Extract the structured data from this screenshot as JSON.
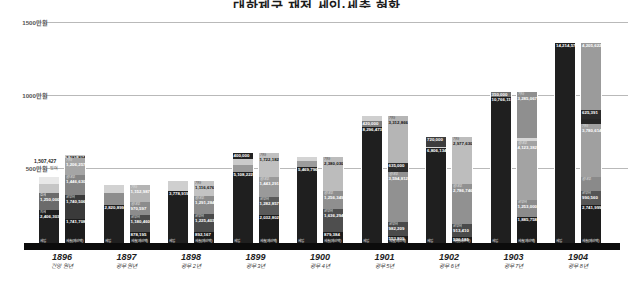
{
  "title": "대한제국 재정 세입·세출 현황",
  "axis": {
    "yticks": [
      {
        "label": "1500만원",
        "value": 15000000
      },
      {
        "label": "1000만원",
        "value": 10000000
      },
      {
        "label": "500만원",
        "value": 5000000
      }
    ],
    "ymax": 15600000,
    "ylabel": "",
    "xlabel": ""
  },
  "legend": {
    "revenue_caption": "세입",
    "expenditure_caption": "세출(예산액)"
  },
  "colors": {
    "revenue_dark": "#2b2b2b",
    "revenue_mid": "#6e6e6e",
    "revenue_light": "#bdbdbd",
    "revenue_pale": "#e2e2e2",
    "expenditure_dark": "#262626",
    "expenditure_mid": "#8f8f8f",
    "expenditure_light": "#a8a8a8",
    "expenditure_pale": "#cfcfcf",
    "axis": "#0c0c0c",
    "grid": "#b9b9b9"
  },
  "chart_data": {
    "type": "bar",
    "subtype": "grouped-stacked",
    "title": "대한제국 재정 세입·세출 현황",
    "xlabel": "",
    "ylabel": "원",
    "ylim": [
      0,
      15600000
    ],
    "grid": true,
    "legend_position": "none",
    "categories": [
      "1896",
      "1897",
      "1898",
      "1899",
      "1900",
      "1901",
      "1902",
      "1903",
      "1904"
    ],
    "category_subtitles": [
      "건양 원년",
      "광무 원년",
      "광무 2년",
      "광무 3년",
      "광무 4년",
      "광무 5년",
      "광무 6년",
      "광무 7년",
      "광무 8년"
    ],
    "series": [
      {
        "name": "세입",
        "values": [
          4809410,
          4191192,
          4527476,
          6473222,
          6162796,
          9079456,
          7586530,
          10766115,
          14214573
        ]
      },
      {
        "name": "세출(예산액)",
        "values": [
          6316831,
          4190427,
          4525530,
          6471132,
          6161871,
          9078681,
          7585877,
          10765491,
          14214298
        ]
      }
    ],
    "totals": [
      {
        "year": "1896",
        "revenue": "4,809,410",
        "revenue_extra": "1,507,427",
        "expenditure": "6,316,831"
      },
      {
        "year": "1897",
        "revenue": "4,191,192",
        "expenditure": "4,190,427"
      },
      {
        "year": "1898",
        "revenue": "4,527,476",
        "expenditure": "4,525,530"
      },
      {
        "year": "1899",
        "revenue": "6,473,222",
        "expenditure": "6,471,132"
      },
      {
        "year": "1900",
        "revenue": "6,162,796",
        "expenditure": "6,161,871"
      },
      {
        "year": "1901",
        "revenue": "9,079,456",
        "expenditure": "9,078,681"
      },
      {
        "year": "1902",
        "revenue": "7,586,530",
        "expenditure": "7,585,877"
      },
      {
        "year": "1903",
        "revenue": "10,766,115",
        "expenditure": "10,765,491"
      },
      {
        "year": "1904",
        "revenue": "14,214,573",
        "expenditure": "14,214,298"
      }
    ]
  },
  "groups": [
    {
      "year": "1896",
      "era": "건양 원년",
      "revenue": {
        "total": 4809410,
        "total_label": "4,809,410",
        "cap_label": "세입",
        "top_note": "1,507,427",
        "top_note2": "잉여",
        "segments": [
          {
            "name": "지세",
            "value": 2406303,
            "label": "2,406,303",
            "color": "#1f1f1f",
            "light": false
          },
          {
            "name": "호세",
            "value": 1250000,
            "label": "1,250,000",
            "color": "#6b6b6b",
            "light": false
          },
          {
            "name": "",
            "value": 600000,
            "label": "",
            "color": "#c6c6c6",
            "light": true
          },
          {
            "name": "",
            "value": 553107,
            "label": "",
            "color": "#e8e8e8",
            "light": true
          }
        ]
      },
      "expenditure": {
        "total": 6316831,
        "total_label": "6,316,831",
        "cap_label": "세출(예산액)",
        "segments": [
          {
            "name": "",
            "value": 1741708,
            "label": "1,741,708",
            "color": "#1c1c1c",
            "light": false
          },
          {
            "name": "군부비",
            "value": 1740506,
            "label": "1,740,506",
            "color": "#3a3a3a",
            "light": false
          },
          {
            "name": "궁내부",
            "value": 1446630,
            "label": "1,446,630",
            "color": "#848484",
            "light": false
          },
          {
            "name": "기타",
            "value": 1206257,
            "label": "1,206,257",
            "color": "#a5a5a5",
            "light": false
          },
          {
            "name": "",
            "value": 181730,
            "label": "2,181,894",
            "color": "#c9c9c9",
            "light": true
          }
        ]
      }
    },
    {
      "year": "1897",
      "era": "광무 원년",
      "revenue": {
        "total": 4191192,
        "total_label": "4,191,192",
        "cap_label": "세입",
        "segments": [
          {
            "name": "",
            "value": 2820899,
            "label": "2,820,899",
            "color": "#1f1f1f",
            "light": false
          },
          {
            "name": "",
            "value": 820000,
            "label": "",
            "color": "#8d8d8d",
            "light": false
          },
          {
            "name": "",
            "value": 550293,
            "label": "",
            "color": "#d2d2d2",
            "light": true
          }
        ]
      },
      "expenditure": {
        "total": 4190427,
        "total_label": "4,190,427",
        "cap_label": "세출(예산액)",
        "segments": [
          {
            "name": "",
            "value": 878195,
            "label": "878,195",
            "color": "#1c1c1c",
            "light": false
          },
          {
            "name": "군부비",
            "value": 1180460,
            "label": "1,180,460",
            "color": "#4a4a4a",
            "light": false
          },
          {
            "name": "궁내부",
            "value": 970597,
            "label": "970,597",
            "color": "#8c8c8c",
            "light": false
          },
          {
            "name": "기타",
            "value": 1161175,
            "label": "1,152,987",
            "color": "#b4b4b4",
            "light": false
          }
        ]
      }
    },
    {
      "year": "1898",
      "era": "광무 2년",
      "revenue": {
        "total": 4527476,
        "total_label": "4,527,476",
        "cap_label": "세입",
        "segments": [
          {
            "name": "",
            "value": 3778919,
            "label": "3,778,919",
            "color": "#1f1f1f",
            "light": false
          },
          {
            "name": "",
            "value": 748557,
            "label": "",
            "color": "#cfcfcf",
            "light": true
          }
        ]
      },
      "expenditure": {
        "total": 4525530,
        "total_label": "4,525,530",
        "cap_label": "세출(예산액)",
        "segments": [
          {
            "name": "",
            "value": 892167,
            "label": "892,167",
            "color": "#1c1c1c",
            "light": false
          },
          {
            "name": "군부비",
            "value": 1225403,
            "label": "1,225,403",
            "color": "#4a4a4a",
            "light": false
          },
          {
            "name": "궁내부",
            "value": 1291284,
            "label": "1,291,284",
            "color": "#8c8c8c",
            "light": false
          },
          {
            "name": "기타",
            "value": 1116676,
            "label": "1,116,676",
            "color": "#c3c3c3",
            "light": true
          }
        ]
      }
    },
    {
      "year": "1899",
      "era": "광무 3년",
      "revenue": {
        "total": 6473222,
        "total_label": "6,473,222",
        "cap_label": "세입",
        "segments": [
          {
            "name": "",
            "value": 5108222,
            "label": "5,108,222",
            "color": "#1f1f1f",
            "light": false
          },
          {
            "name": "",
            "value": 500000,
            "label": "",
            "color": "#9a9a9a",
            "light": false
          },
          {
            "name": "",
            "value": 465000,
            "label": "",
            "color": "#cbcbcb",
            "light": true
          },
          {
            "name": "",
            "value": 400000,
            "label": "400,000",
            "color": "#222222",
            "light": false
          }
        ]
      },
      "expenditure": {
        "total": 6471132,
        "total_label": "6,471,132",
        "cap_label": "세출(예산액)",
        "segments": [
          {
            "name": "",
            "value": 2032802,
            "label": "2,032,802",
            "color": "#1c1c1c",
            "light": false
          },
          {
            "name": "군부비",
            "value": 1282857,
            "label": "1,282,857",
            "color": "#5a5a5a",
            "light": false
          },
          {
            "name": "궁내부",
            "value": 1443291,
            "label": "1,443,291",
            "color": "#9a9a9a",
            "light": false
          },
          {
            "name": "기타",
            "value": 1712182,
            "label": "1,722,182",
            "color": "#c0c0c0",
            "light": true
          }
        ]
      }
    },
    {
      "year": "1900",
      "era": "광무 4년",
      "revenue": {
        "total": 6162796,
        "total_label": "6,162,796",
        "cap_label": "세입",
        "segments": [
          {
            "name": "",
            "value": 5469796,
            "label": "5,469,796",
            "color": "#1f1f1f",
            "light": false
          },
          {
            "name": "",
            "value": 420000,
            "label": "",
            "color": "#9c9c9c",
            "light": false
          },
          {
            "name": "",
            "value": 273000,
            "label": "",
            "color": "#d4d4d4",
            "light": true
          }
        ]
      },
      "expenditure": {
        "total": 6161871,
        "total_label": "6,161,871",
        "cap_label": "세출(예산액)",
        "segments": [
          {
            "name": "",
            "value": 879384,
            "label": "879,384",
            "color": "#1c1c1c",
            "light": false
          },
          {
            "name": "군부비",
            "value": 1636294,
            "label": "1,636,294",
            "color": "#4e4e4e",
            "light": false
          },
          {
            "name": "궁내부",
            "value": 1256349,
            "label": "1,256,349",
            "color": "#8f8f8f",
            "light": false
          },
          {
            "name": "기타",
            "value": 2389844,
            "label": "2,380,030",
            "color": "#bcbcbc",
            "light": true
          }
        ]
      }
    },
    {
      "year": "1901",
      "era": "광무 5년",
      "revenue": {
        "total": 9079456,
        "total_label": "9,079,456",
        "cap_label": "세입",
        "segments": [
          {
            "name": "",
            "value": 8296473,
            "label": "8,296,473",
            "color": "#1f1f1f",
            "light": false
          },
          {
            "name": "",
            "value": 420000,
            "label": "420,000",
            "color": "#7c7c7c",
            "light": false
          },
          {
            "name": "",
            "value": 362983,
            "label": "",
            "color": "#cfcfcf",
            "light": true
          }
        ]
      },
      "expenditure": {
        "total": 9078681,
        "total_label": "9,078,681",
        "cap_label": "세출(예산액)",
        "segments": [
          {
            "name": "",
            "value": 553809,
            "label": "553,809",
            "color": "#1c1c1c",
            "light": false
          },
          {
            "name": "군부비",
            "value": 982209,
            "label": "982,209",
            "color": "#4a4a4a",
            "light": false
          },
          {
            "name": "궁내부",
            "value": 3594812,
            "label": "3,594,812",
            "color": "#919191",
            "light": false
          },
          {
            "name": "",
            "value": 635000,
            "label": "635,000",
            "color": "#2e2e2e",
            "light": false
          },
          {
            "name": "기타",
            "value": 3312866,
            "label": "3,312,866",
            "color": "#b5b5b5",
            "light": true
          }
        ]
      }
    },
    {
      "year": "1902",
      "era": "광무 6년",
      "revenue": {
        "total": 7586530,
        "total_label": "7,586,530",
        "cap_label": "세입",
        "segments": [
          {
            "name": "",
            "value": 6806134,
            "label": "6,806,134",
            "color": "#1f1f1f",
            "light": false
          },
          {
            "name": "",
            "value": 20000,
            "label": "",
            "color": "#9e9e9e",
            "light": false
          },
          {
            "name": "",
            "value": 40396,
            "label": "",
            "color": "#d6d6d6",
            "light": true
          },
          {
            "name": "",
            "value": 720000,
            "label": "720,000",
            "color": "#3d3d3d",
            "light": false
          }
        ]
      },
      "expenditure": {
        "total": 7585877,
        "total_label": "7,585,877",
        "cap_label": "세출(예산액)",
        "segments": [
          {
            "name": "",
            "value": 526181,
            "label": "526,181",
            "color": "#1c1c1c",
            "light": false
          },
          {
            "name": "군부비",
            "value": 913410,
            "label": "913,410",
            "color": "#4a4a4a",
            "light": false
          },
          {
            "name": "궁내부",
            "value": 2786746,
            "label": "2,786,746",
            "color": "#919191",
            "light": false
          },
          {
            "name": "기타",
            "value": 3359540,
            "label": "2,977,630",
            "color": "#bdbdbd",
            "light": true
          }
        ]
      }
    },
    {
      "year": "1903",
      "era": "광무 7년",
      "revenue": {
        "total": 10766115,
        "total_label": "10,766,115",
        "cap_label": "세입",
        "segments": [
          {
            "name": "",
            "value": 10366115,
            "label": "10,766,115",
            "color": "#1f1f1f",
            "light": false
          },
          {
            "name": "",
            "value": 400000,
            "label": "350,000",
            "color": "#6f6f6f",
            "light": false
          }
        ]
      },
      "expenditure": {
        "total": 10765491,
        "total_label": "10,765,491",
        "cap_label": "세출(예산액)",
        "segments": [
          {
            "name": "",
            "value": 1885758,
            "label": "1,885,758",
            "color": "#1c1c1c",
            "light": false
          },
          {
            "name": "군부비",
            "value": 1253000,
            "label": "1,253,000",
            "color": "#8b8b8b",
            "light": false
          },
          {
            "name": "궁내부",
            "value": 4123382,
            "label": "4,123,382",
            "color": "#a3a3a3",
            "light": false
          },
          {
            "name": "",
            "value": 220000,
            "label": "",
            "color": "#d8d8d8",
            "light": true
          },
          {
            "name": "기타",
            "value": 3283351,
            "label": "3,285,067",
            "color": "#8f8f8f",
            "light": false
          }
        ]
      }
    },
    {
      "year": "1904",
      "era": "광무 8년",
      "revenue": {
        "total": 14214573,
        "total_label": "14,214,573",
        "cap_label": "세입",
        "segments": [
          {
            "name": "",
            "value": 14214573,
            "label": "14,214,573",
            "color": "#1f1f1f",
            "light": false
          }
        ]
      },
      "expenditure": {
        "total": 14214298,
        "total_label": "14,214,298",
        "cap_label": "세출(예산액)",
        "segments": [
          {
            "name": "",
            "value": 2741999,
            "label": "2,741,999",
            "color": "#1c1c1c",
            "light": false
          },
          {
            "name": "군부비",
            "value": 990560,
            "label": "990,560",
            "color": "#555555",
            "light": false
          },
          {
            "name": "궁내부",
            "value": 980560,
            "label": "",
            "color": "#8a8a8a",
            "light": false
          },
          {
            "name": "기타",
            "value": 3780614,
            "label": "3,780,614",
            "color": "#a0a0a0",
            "light": false
          },
          {
            "name": "",
            "value": 360000,
            "label": "",
            "color": "#262626",
            "light": false
          },
          {
            "name": "",
            "value": 625391,
            "label": "625,391",
            "color": "#2b2b2b",
            "light": false
          },
          {
            "name": "",
            "value": 4735174,
            "label": "4,205,622",
            "color": "#9b9b9b",
            "light": false
          }
        ]
      }
    }
  ]
}
